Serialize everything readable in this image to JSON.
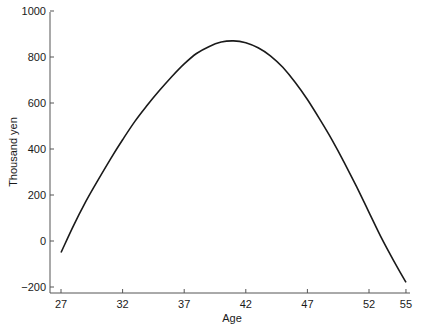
{
  "chart_data": {
    "type": "line",
    "title": "",
    "xlabel": "Age",
    "ylabel": "Thousand yen",
    "xlim": [
      27,
      55
    ],
    "ylim": [
      -230,
      1000
    ],
    "x_ticks": [
      27,
      32,
      37,
      42,
      47,
      52,
      55
    ],
    "y_ticks": [
      -200,
      0,
      200,
      400,
      600,
      800,
      1000
    ],
    "grid": false,
    "legend": null,
    "series": [
      {
        "name": "profile",
        "x": [
          27,
          28,
          29,
          30,
          31,
          32,
          33,
          34,
          35,
          36,
          37,
          38,
          39,
          40,
          41,
          42,
          43,
          44,
          45,
          46,
          47,
          48,
          49,
          50,
          51,
          52,
          53,
          54,
          55
        ],
        "values": [
          -50,
          65,
          170,
          265,
          355,
          440,
          520,
          590,
          655,
          715,
          770,
          815,
          845,
          865,
          870,
          862,
          840,
          805,
          755,
          690,
          615,
          530,
          440,
          340,
          235,
          125,
          15,
          -85,
          -180
        ]
      }
    ]
  }
}
